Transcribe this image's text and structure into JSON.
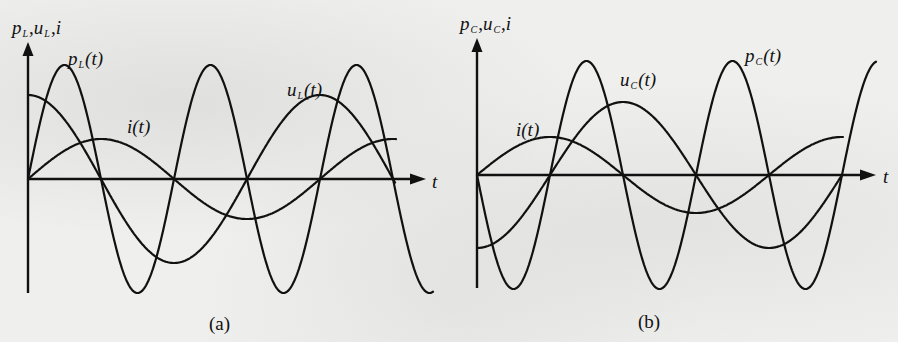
{
  "figure": {
    "panels": [
      {
        "id": "a",
        "caption": "(a)",
        "y_axis_label": {
          "p": "p",
          "p_sub": "L",
          "u": "u",
          "u_sub": "L",
          "i": "i",
          "sep": ","
        },
        "x_axis_label": "t",
        "curve_labels": {
          "power": {
            "base": "p",
            "sub": "L",
            "arg": "(t)"
          },
          "voltage": {
            "base": "u",
            "sub": "L",
            "arg": "(t)"
          },
          "current": {
            "base": "i",
            "sub": "",
            "arg": "(t)"
          }
        }
      },
      {
        "id": "b",
        "caption": "(b)",
        "y_axis_label": {
          "p": "p",
          "p_sub": "C",
          "u": "u",
          "u_sub": "C",
          "i": "i",
          "sep": ","
        },
        "x_axis_label": "t",
        "curve_labels": {
          "power": {
            "base": "p",
            "sub": "C",
            "arg": "(t)"
          },
          "voltage": {
            "base": "u",
            "sub": "C",
            "arg": "(t)"
          },
          "current": {
            "base": "i",
            "sub": "",
            "arg": "(t)"
          }
        }
      }
    ]
  },
  "chart_data": [
    {
      "type": "line",
      "title": "(a) Inductor: instantaneous power, voltage and current",
      "xlabel": "t",
      "ylabel": "p_L, u_L, i",
      "x_unit": "phase (quarter periods of i)",
      "x": [
        0,
        0.5,
        1,
        1.5,
        2,
        2.5,
        3,
        3.5,
        4,
        4.5,
        5
      ],
      "series": [
        {
          "name": "p_L(t)",
          "formula": "sin(2θ)",
          "amplitude_rel": 1.0,
          "values": [
            0,
            1,
            0,
            -1,
            0,
            1,
            0,
            -1,
            0,
            1,
            0
          ]
        },
        {
          "name": "u_L(t)",
          "formula": "cos(θ)",
          "amplitude_rel": 0.72,
          "values": [
            0.72,
            0.51,
            0,
            -0.51,
            -0.72,
            -0.51,
            0,
            0.51,
            0.72,
            0.51,
            0
          ]
        },
        {
          "name": "i(t)",
          "formula": "sin(θ)",
          "amplitude_rel": 0.35,
          "values": [
            0,
            0.25,
            0.35,
            0.25,
            0,
            -0.25,
            -0.35,
            -0.25,
            0,
            0.25,
            0.35
          ]
        }
      ],
      "grid": false,
      "legend": "inline labels"
    },
    {
      "type": "line",
      "title": "(b) Capacitor: instantaneous power, voltage and current",
      "xlabel": "t",
      "ylabel": "p_C, u_C, i",
      "x_unit": "phase (quarter periods of i)",
      "x": [
        0,
        0.5,
        1,
        1.5,
        2,
        2.5,
        3,
        3.5,
        4,
        4.5,
        5
      ],
      "series": [
        {
          "name": "p_C(t)",
          "formula": "-sin(2θ)",
          "amplitude_rel": 1.0,
          "values": [
            0,
            -1,
            0,
            1,
            0,
            -1,
            0,
            1,
            0,
            -1,
            0
          ]
        },
        {
          "name": "u_C(t)",
          "formula": "-cos(θ)",
          "amplitude_rel": 0.64,
          "values": [
            -0.64,
            -0.45,
            0,
            0.45,
            0.64,
            0.45,
            0,
            -0.45,
            -0.64,
            -0.45,
            0
          ]
        },
        {
          "name": "i(t)",
          "formula": "sin(θ)",
          "amplitude_rel": 0.33,
          "values": [
            0,
            0.23,
            0.33,
            0.23,
            0,
            -0.23,
            -0.33,
            -0.23,
            0,
            0.23,
            0.33
          ]
        }
      ],
      "grid": false,
      "legend": "inline labels"
    }
  ]
}
